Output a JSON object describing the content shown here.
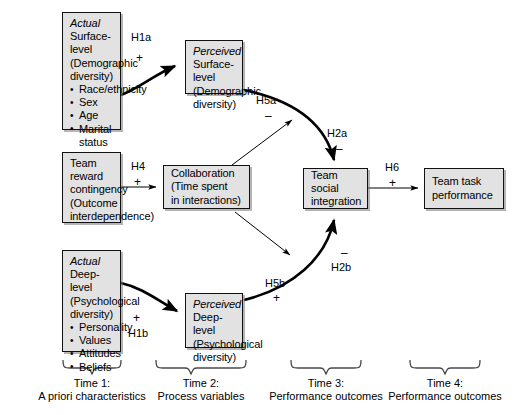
{
  "diagram": {
    "nodes": {
      "actual_surface": {
        "emphasis": "Actual",
        "line1": "Surface-level",
        "line2": "(Demographic",
        "line3": "diversity)",
        "bullets": [
          "Race/ethnicity",
          "Sex",
          "Age",
          "Marital status"
        ]
      },
      "perceived_surface": {
        "emphasis": "Perceived",
        "line1": "Surface-level",
        "line2": "(Demographic",
        "line3": "diversity)"
      },
      "team_reward": {
        "line1": "Team",
        "line2": "reward",
        "line3": "contingency",
        "line4": "(Outcome",
        "line5": "interdependence)"
      },
      "collaboration": {
        "line1": "Collaboration",
        "line2": "(Time spent",
        "line3": "in interactions)"
      },
      "team_social_integration": {
        "line1": "Team",
        "line2": "social",
        "line3": "integration"
      },
      "team_task_performance": {
        "line1": "Team task",
        "line2": "performance"
      },
      "actual_deep": {
        "emphasis": "Actual",
        "line1": "Deep-level",
        "line2": "(Psychological",
        "line3": "diversity)",
        "bullets": [
          "Personality",
          "Values",
          "Attitudes",
          "Beliefs"
        ]
      },
      "perceived_deep": {
        "emphasis": "Perceived",
        "line1": "Deep-level",
        "line2": "(Psychological",
        "line3": "diversity)"
      }
    },
    "hypotheses": [
      {
        "id": "h1a",
        "label": "H1a",
        "sign": "+"
      },
      {
        "id": "h1b",
        "label": "H1b",
        "sign": "+"
      },
      {
        "id": "h2a",
        "label": "H2a",
        "sign": "–"
      },
      {
        "id": "h2b",
        "label": "H2b",
        "sign": "–"
      },
      {
        "id": "h4",
        "label": "H4",
        "sign": "+"
      },
      {
        "id": "h5a",
        "label": "H5a",
        "sign": "–"
      },
      {
        "id": "h5b",
        "label": "H5b",
        "sign": "+"
      },
      {
        "id": "h6",
        "label": "H6",
        "sign": "+"
      }
    ],
    "timeline": [
      {
        "id": "time1",
        "line1": "Time 1:",
        "line2": "A priori characteristics"
      },
      {
        "id": "time2",
        "line1": "Time 2:",
        "line2": "Process variables"
      },
      {
        "id": "time3",
        "line1": "Time 3:",
        "line2": "Performance outcomes"
      },
      {
        "id": "time4",
        "line1": "Time 4:",
        "line2": "Performance outcomes"
      }
    ],
    "colors": {
      "box_fill": "#e2e2e2",
      "box_stroke": "#111111",
      "arrow": "#000000",
      "background": "#ffffff"
    }
  }
}
